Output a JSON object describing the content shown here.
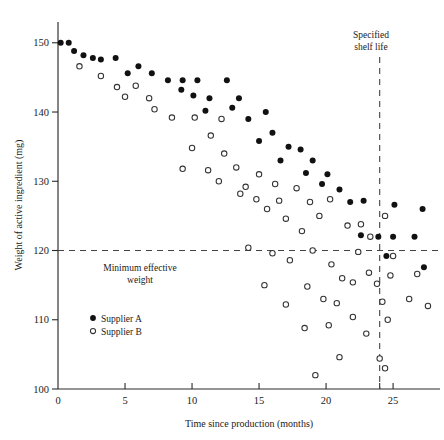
{
  "chart_data": {
    "type": "scatter",
    "title": "",
    "xlabel": "Time since production (months)",
    "ylabel": "Weight of active ingredient (mg)",
    "xlim": [
      0,
      28.5
    ],
    "ylim": [
      100,
      153
    ],
    "xticks": [
      0,
      5,
      10,
      15,
      20,
      25
    ],
    "xticklabels": [
      "0",
      "5",
      "10",
      "15",
      "20",
      "25"
    ],
    "extra_xticks": [
      24
    ],
    "yticks": [
      100,
      110,
      120,
      130,
      140,
      150
    ],
    "yticklabels": [
      "100",
      "110",
      "120",
      "130",
      "140",
      "150"
    ],
    "grid": false,
    "legend_position": "lower-left",
    "series": [
      {
        "name": "Supplier A",
        "marker": "filled-circle",
        "color": "#111111",
        "points": [
          [
            0.2,
            150.0
          ],
          [
            0.8,
            150.0
          ],
          [
            1.2,
            148.8
          ],
          [
            1.9,
            148.2
          ],
          [
            2.6,
            147.8
          ],
          [
            3.2,
            147.6
          ],
          [
            4.3,
            147.8
          ],
          [
            6.0,
            146.6
          ],
          [
            5.2,
            145.6
          ],
          [
            7.0,
            145.6
          ],
          [
            8.2,
            144.6
          ],
          [
            9.3,
            144.6
          ],
          [
            10.4,
            144.6
          ],
          [
            9.2,
            143.2
          ],
          [
            10.1,
            142.4
          ],
          [
            11.3,
            142.0
          ],
          [
            12.6,
            144.6
          ],
          [
            13.5,
            142.0
          ],
          [
            11.0,
            140.2
          ],
          [
            13.0,
            140.6
          ],
          [
            15.5,
            140.0
          ],
          [
            14.2,
            139.0
          ],
          [
            16.0,
            137.0
          ],
          [
            15.0,
            135.8
          ],
          [
            17.2,
            135.0
          ],
          [
            18.1,
            134.6
          ],
          [
            16.6,
            133.0
          ],
          [
            19.0,
            133.0
          ],
          [
            18.5,
            131.2
          ],
          [
            20.1,
            131.0
          ],
          [
            19.7,
            129.6
          ],
          [
            21.0,
            128.8
          ],
          [
            21.8,
            127.0
          ],
          [
            22.8,
            127.2
          ],
          [
            23.9,
            122.0
          ],
          [
            22.6,
            122.2
          ],
          [
            25.1,
            126.6
          ],
          [
            25.0,
            122.0
          ],
          [
            27.2,
            126.0
          ],
          [
            26.6,
            122.0
          ],
          [
            24.5,
            119.2
          ],
          [
            27.3,
            117.6
          ]
        ]
      },
      {
        "name": "Supplier B",
        "marker": "open-circle",
        "color": "#ffffff",
        "points": [
          [
            1.6,
            146.6
          ],
          [
            3.2,
            145.2
          ],
          [
            4.4,
            143.6
          ],
          [
            5.8,
            143.8
          ],
          [
            5.0,
            142.2
          ],
          [
            6.8,
            142.0
          ],
          [
            7.2,
            140.4
          ],
          [
            8.5,
            139.2
          ],
          [
            10.2,
            139.2
          ],
          [
            12.2,
            139.0
          ],
          [
            11.4,
            136.6
          ],
          [
            10.0,
            134.8
          ],
          [
            12.4,
            134.0
          ],
          [
            9.3,
            131.8
          ],
          [
            11.2,
            131.6
          ],
          [
            13.3,
            132.0
          ],
          [
            15.0,
            131.0
          ],
          [
            12.0,
            130.0
          ],
          [
            14.0,
            129.2
          ],
          [
            16.2,
            129.6
          ],
          [
            13.6,
            128.2
          ],
          [
            17.8,
            129.0
          ],
          [
            14.8,
            127.4
          ],
          [
            16.5,
            127.2
          ],
          [
            18.8,
            127.0
          ],
          [
            20.3,
            127.4
          ],
          [
            15.6,
            126.0
          ],
          [
            19.5,
            125.0
          ],
          [
            17.0,
            124.6
          ],
          [
            18.2,
            122.8
          ],
          [
            21.6,
            123.6
          ],
          [
            22.6,
            123.8
          ],
          [
            23.3,
            122.0
          ],
          [
            24.4,
            125.0
          ],
          [
            14.2,
            120.4
          ],
          [
            16.0,
            119.6
          ],
          [
            17.3,
            118.6
          ],
          [
            19.0,
            120.0
          ],
          [
            22.4,
            119.8
          ],
          [
            20.4,
            118.0
          ],
          [
            25.0,
            119.2
          ],
          [
            21.2,
            116.0
          ],
          [
            23.2,
            116.8
          ],
          [
            24.8,
            116.4
          ],
          [
            26.8,
            116.6
          ],
          [
            15.4,
            115.0
          ],
          [
            18.6,
            114.8
          ],
          [
            22.0,
            115.4
          ],
          [
            23.8,
            115.2
          ],
          [
            19.8,
            113.0
          ],
          [
            17.0,
            112.2
          ],
          [
            20.8,
            112.4
          ],
          [
            24.2,
            112.6
          ],
          [
            22.0,
            110.4
          ],
          [
            26.2,
            113.0
          ],
          [
            27.6,
            112.0
          ],
          [
            18.4,
            108.8
          ],
          [
            20.2,
            109.2
          ],
          [
            23.0,
            108.0
          ],
          [
            24.6,
            110.0
          ],
          [
            21.0,
            104.6
          ],
          [
            24.0,
            104.4
          ],
          [
            19.2,
            102.0
          ],
          [
            24.4,
            103.0
          ]
        ]
      }
    ],
    "reference_lines": [
      {
        "name": "minimum-effective-weight",
        "orientation": "horizontal",
        "value": 120,
        "label": "Minimum effective\nweight",
        "label_line1": "Minimum effective",
        "label_line2": "weight",
        "style": "dashed"
      },
      {
        "name": "specified-shelf-life",
        "orientation": "vertical",
        "value": 24,
        "label": "Specified\nshelf life",
        "label_line1": "Specified",
        "label_line2": "shelf life",
        "style": "dashed"
      }
    ],
    "legend": [
      {
        "label": "Supplier A",
        "marker": "filled-circle"
      },
      {
        "label": "Supplier B",
        "marker": "open-circle"
      }
    ]
  }
}
